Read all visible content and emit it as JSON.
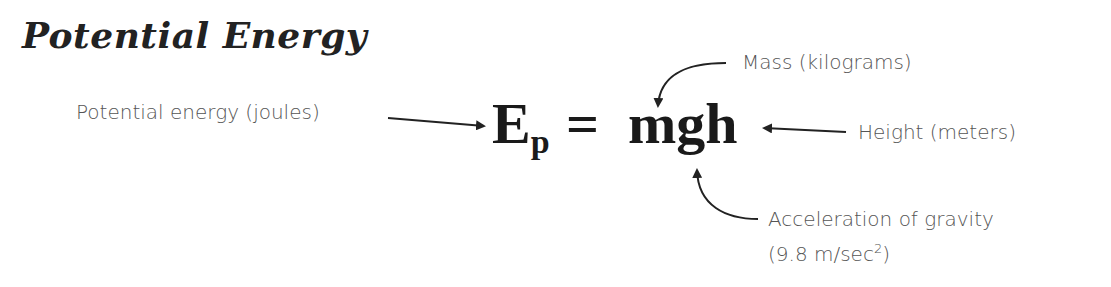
{
  "title": "Potential Energy",
  "formula": {
    "lhs": "E",
    "lhs_subscript": "p",
    "equals": "=",
    "rhs": "mgh"
  },
  "labels": {
    "potential_energy": "Potential energy (joules)",
    "mass": "Mass (kilograms)",
    "height": "Height (meters)",
    "acceleration_line1": "Acceleration of gravity",
    "acceleration_line2_prefix": "(9.8 m/sec",
    "acceleration_line2_sup": "2",
    "acceleration_line2_suffix": ")"
  },
  "colors": {
    "text": "#555555",
    "formula": "#1a1a1a",
    "arrow": "#222222"
  }
}
